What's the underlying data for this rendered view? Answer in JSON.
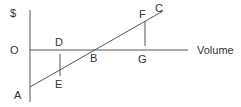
{
  "diagram": {
    "y_axis_label": "$",
    "x_axis_label": "Volume",
    "points": {
      "origin": "O",
      "A": "A",
      "B": "B",
      "C": "C",
      "D": "D",
      "E": "E",
      "F": "F",
      "G": "G"
    },
    "colors": {
      "line": "#555555",
      "text": "#333333"
    }
  }
}
